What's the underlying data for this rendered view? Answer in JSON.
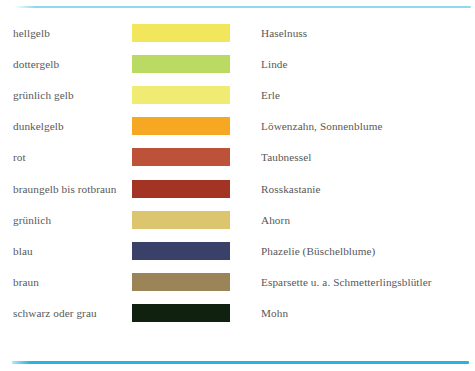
{
  "document": {
    "type": "pollen-colour-legend-table",
    "background_color": "#ffffff",
    "text_color": "#58585a",
    "rules": {
      "top_line_color": "#8fd8ef",
      "bottom_line_color": "#28b4e1"
    }
  },
  "columns": {
    "shade_header": "Farbe",
    "swatch_header": "Farbmuster",
    "plant_header": "Pflanze"
  },
  "rows": [
    {
      "shade": "hellgelb",
      "color": "#f2e65c",
      "plant": "Haselnuss"
    },
    {
      "shade": "dottergelb",
      "color": "#bada63",
      "plant": "Linde"
    },
    {
      "shade": "grünlich gelb",
      "color": "#f0ec73",
      "plant": "Erle"
    },
    {
      "shade": "dunkelgelb",
      "color": "#f7a823",
      "plant": "Löwenzahn, Sonnenblume"
    },
    {
      "shade": "rot",
      "color": "#bb5239",
      "plant": "Taubnessel"
    },
    {
      "shade": "braungelb bis rotbraun",
      "color": "#a33423",
      "plant": "Rosskastanie"
    },
    {
      "shade": "grünlich",
      "color": "#dbc56f",
      "plant": "Ahorn"
    },
    {
      "shade": "blau",
      "color": "#3a4169",
      "plant": "Phazelie (Büschelblume)"
    },
    {
      "shade": "braun",
      "color": "#9b8458",
      "plant": "Esparsette u. a. Schmetterlingsblütler"
    },
    {
      "shade": "schwarz oder grau",
      "color": "#10220f",
      "plant": "Mohn"
    }
  ]
}
